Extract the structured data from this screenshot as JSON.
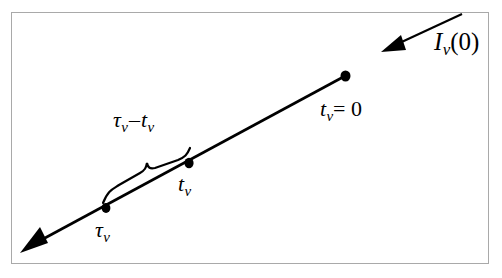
{
  "figure": {
    "type": "radiative-transfer-ray-diagram",
    "background_color": "#ffffff",
    "frame_color": "#a9a9a9",
    "ink_color": "#000000",
    "labels": {
      "incident_intensity": {
        "symbol": "I",
        "subscript": "ν",
        "argument": "(0)",
        "full_text": "Iν(0)"
      },
      "optical_depth_zero": {
        "symbol": "t",
        "subscript": "ν",
        "relation": "= 0",
        "full_text": "tν = 0"
      },
      "interval": {
        "first_symbol": "τ",
        "first_subscript": "ν",
        "operator": "–",
        "second_symbol": "t",
        "second_subscript": "ν",
        "full_text": "τν – tν"
      },
      "tau_point": {
        "symbol": "τ",
        "subscript": "ν",
        "full_text": "τν"
      },
      "t_point": {
        "symbol": "t",
        "subscript": "ν",
        "full_text": "tν"
      }
    },
    "geometry": {
      "ray_line": {
        "x1": 345,
        "y1": 76,
        "x2": 30,
        "y2": 246
      },
      "ray_arrow_tip": {
        "x": 20,
        "y": 252
      },
      "incident_arrow": {
        "x1": 462,
        "y1": 15,
        "x2": 385,
        "y2": 50
      },
      "points": [
        {
          "name": "t-nu-zero-point",
          "x": 345,
          "y": 76
        },
        {
          "name": "t-nu-point",
          "x": 189,
          "y": 163
        },
        {
          "name": "tau-nu-point",
          "x": 106,
          "y": 208
        }
      ],
      "brace": {
        "start_x": 104,
        "start_y": 202,
        "end_x": 191,
        "end_y": 155
      }
    }
  }
}
